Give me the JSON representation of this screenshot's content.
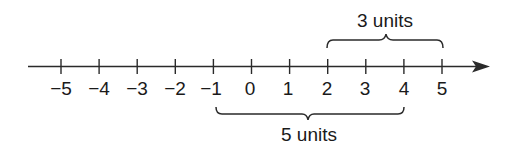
{
  "diagram": {
    "type": "number-line",
    "colors": {
      "stroke": "#2a2a2a",
      "text": "#1a1a1a",
      "background": "#ffffff"
    },
    "axis": {
      "min": -5,
      "max": 5,
      "arrow": "right",
      "ticks": [
        {
          "value": -5,
          "label": "−5"
        },
        {
          "value": -4,
          "label": "−4"
        },
        {
          "value": -3,
          "label": "−3"
        },
        {
          "value": -2,
          "label": "−2"
        },
        {
          "value": -1,
          "label": "−1"
        },
        {
          "value": 0,
          "label": "0"
        },
        {
          "value": 1,
          "label": "1"
        },
        {
          "value": 2,
          "label": "2"
        },
        {
          "value": 3,
          "label": "3"
        },
        {
          "value": 4,
          "label": "4"
        },
        {
          "value": 5,
          "label": "5"
        }
      ]
    },
    "braces": [
      {
        "position": "above",
        "from": 2,
        "to": 5,
        "label": "3 units"
      },
      {
        "position": "below",
        "from": -1,
        "to": 4,
        "label": "5 units"
      }
    ]
  }
}
